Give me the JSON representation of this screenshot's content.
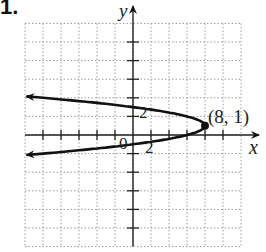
{
  "problem_number": "1.",
  "chart_data": {
    "type": "line",
    "title": "",
    "xlabel": "x",
    "ylabel": "y",
    "xlim": [
      -12,
      12
    ],
    "ylim": [
      -12,
      12
    ],
    "grid": true,
    "grid_step": 2,
    "tick_labels": {
      "x": "2",
      "y": "2",
      "origin": "0"
    },
    "series": [
      {
        "name": "parabola x = 8 - 2(y - 1)^2",
        "vertex": [
          8,
          1
        ],
        "opens": "left",
        "arrows": "both"
      }
    ],
    "annotations": [
      {
        "text": "(8, 1)",
        "point": [
          8,
          1
        ]
      }
    ]
  },
  "labels": {
    "x_axis": "x",
    "y_axis": "y",
    "origin": "0",
    "x_tick": "2",
    "y_tick": "2",
    "vertex": "(8, 1)"
  }
}
